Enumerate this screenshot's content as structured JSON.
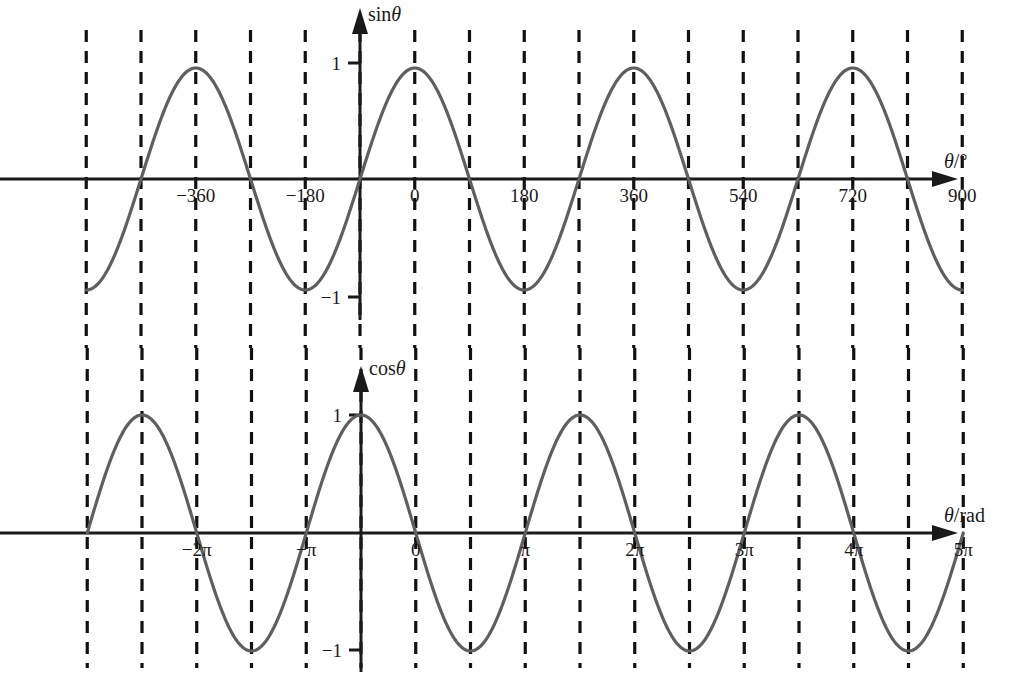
{
  "figure": {
    "width": 1018,
    "height": 696,
    "background": "#ffffff",
    "curve_color": "#5f5f5f",
    "axis_color": "#1a1a1a",
    "grid_color": "#111111"
  },
  "charts": [
    {
      "id": "sine-chart",
      "axis_label": "sin",
      "axis_label_symbol": "θ",
      "x_axis_label_prefix": "θ",
      "x_axis_label_suffix": "/°",
      "y_tick_top": "1",
      "y_tick_bottom": "−1",
      "origin_label": "0",
      "x_tick_labels": [
        "−360",
        "−180",
        "0",
        "180",
        "360",
        "540",
        "720",
        "900"
      ]
    },
    {
      "id": "cosine-chart",
      "axis_label": "cos",
      "axis_label_symbol": "θ",
      "x_axis_label_prefix": "θ",
      "x_axis_label_suffix": "/rad",
      "y_tick_top": "1",
      "y_tick_bottom": "−1",
      "origin_label": "0",
      "x_tick_labels": [
        "−2π",
        "−π",
        "0",
        "π",
        "2π",
        "3π",
        "4π",
        "5π"
      ]
    }
  ],
  "chart_data": [
    {
      "type": "line",
      "title": "",
      "function": "sin",
      "xlabel": "θ/°",
      "ylabel": "sinθ",
      "xlim": [
        -450,
        990
      ],
      "ylim": [
        -1.25,
        1.25
      ],
      "x_ticks": [
        -360,
        -180,
        0,
        180,
        360,
        540,
        720,
        900
      ],
      "x_tick_labels": [
        "−360",
        "−180",
        "0",
        "180",
        "360",
        "540",
        "720",
        "900"
      ],
      "y_ticks": [
        -1,
        1
      ],
      "y_tick_labels": [
        "−1",
        "1"
      ],
      "grid": "vertical-dashed-every-90-degrees",
      "gridlines_x": [
        -450,
        -360,
        -270,
        -180,
        -90,
        0,
        90,
        180,
        270,
        360,
        450,
        540,
        630,
        720,
        810,
        900,
        990
      ],
      "legend": "none",
      "key_points": [
        {
          "x": -360,
          "y": 0
        },
        {
          "x": -270,
          "y": -1
        },
        {
          "x": -180,
          "y": 0
        },
        {
          "x": -90,
          "y": 1
        },
        {
          "x": 0,
          "y": 0
        },
        {
          "x": 90,
          "y": 1
        },
        {
          "x": 180,
          "y": 0
        },
        {
          "x": 270,
          "y": -1
        },
        {
          "x": 360,
          "y": 0
        },
        {
          "x": 450,
          "y": 1
        },
        {
          "x": 540,
          "y": 0
        },
        {
          "x": 630,
          "y": -1
        },
        {
          "x": 720,
          "y": 0
        },
        {
          "x": 810,
          "y": 1
        },
        {
          "x": 900,
          "y": 0
        }
      ]
    },
    {
      "type": "line",
      "title": "",
      "function": "cos",
      "xlabel": "θ/rad",
      "ylabel": "cosθ",
      "xlim": [
        -2.5,
        5.5
      ],
      "ylim": [
        -1.3,
        1.3
      ],
      "x_ticks": [
        -2,
        -1,
        0,
        1,
        2,
        3,
        4,
        5
      ],
      "x_tick_labels": [
        "−2π",
        "−π",
        "0",
        "π",
        "2π",
        "3π",
        "4π",
        "5π"
      ],
      "y_ticks": [
        -1,
        1
      ],
      "y_tick_labels": [
        "−1",
        "1"
      ],
      "grid": "vertical-dashed-every-half-pi",
      "gridlines_x": [
        -2.5,
        -2.0,
        -1.5,
        -1.0,
        -0.5,
        0,
        0.5,
        1.0,
        1.5,
        2.0,
        2.5,
        3.0,
        3.5,
        4.0,
        4.5,
        5.0,
        5.5
      ],
      "legend": "none",
      "key_points": [
        {
          "x": -2.0,
          "y": 1
        },
        {
          "x": -1.5,
          "y": 0
        },
        {
          "x": -1.0,
          "y": -1
        },
        {
          "x": -0.5,
          "y": 0
        },
        {
          "x": 0,
          "y": 1
        },
        {
          "x": 0.5,
          "y": 0
        },
        {
          "x": 1.0,
          "y": -1
        },
        {
          "x": 1.5,
          "y": 0
        },
        {
          "x": 2.0,
          "y": 1
        },
        {
          "x": 2.5,
          "y": 0
        },
        {
          "x": 3.0,
          "y": -1
        },
        {
          "x": 3.5,
          "y": 0
        },
        {
          "x": 4.0,
          "y": 1
        },
        {
          "x": 4.5,
          "y": 0
        },
        {
          "x": 5.0,
          "y": -1
        }
      ]
    }
  ]
}
